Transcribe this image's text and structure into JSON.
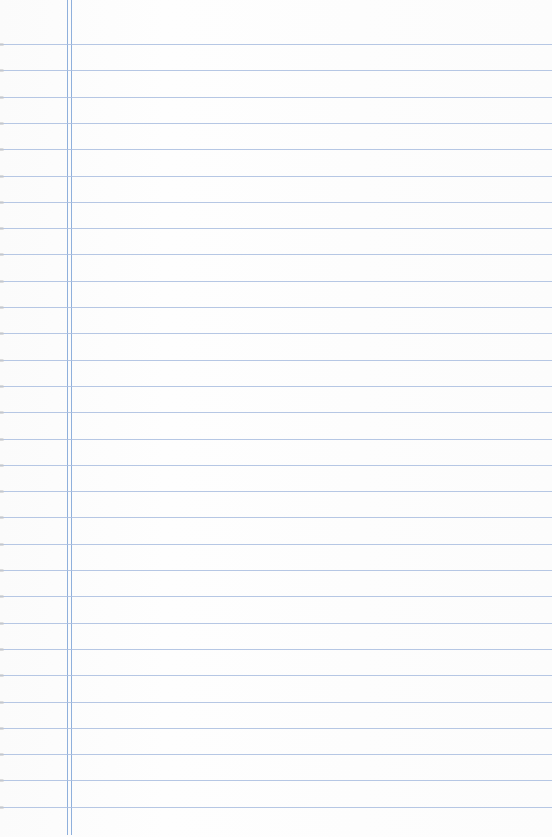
{
  "paper": {
    "type": "lined-notebook-paper",
    "background": "#fdfdfd",
    "rule_color": "#a9bddf",
    "margin_color": "#8fb0dc",
    "first_rule_y": 44,
    "rule_spacing": 26.3,
    "rule_count": 30,
    "margin_lines_x": [
      67,
      71
    ],
    "written_text": ""
  }
}
